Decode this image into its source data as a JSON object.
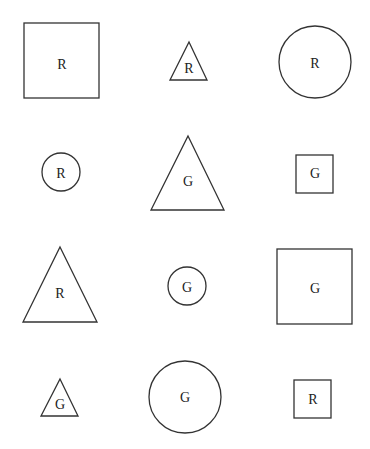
{
  "grid": {
    "rows": 4,
    "cols": 3,
    "shapes": [
      {
        "row": 1,
        "col": 1,
        "type": "square",
        "size": "large",
        "label": "R"
      },
      {
        "row": 1,
        "col": 2,
        "type": "triangle",
        "size": "small",
        "label": "R"
      },
      {
        "row": 1,
        "col": 3,
        "type": "circle",
        "size": "large",
        "label": "R"
      },
      {
        "row": 2,
        "col": 1,
        "type": "circle",
        "size": "small",
        "label": "R"
      },
      {
        "row": 2,
        "col": 2,
        "type": "triangle",
        "size": "large",
        "label": "G"
      },
      {
        "row": 2,
        "col": 3,
        "type": "square",
        "size": "small",
        "label": "G"
      },
      {
        "row": 3,
        "col": 1,
        "type": "triangle",
        "size": "large",
        "label": "R"
      },
      {
        "row": 3,
        "col": 2,
        "type": "circle",
        "size": "small",
        "label": "G"
      },
      {
        "row": 3,
        "col": 3,
        "type": "square",
        "size": "large",
        "label": "G"
      },
      {
        "row": 4,
        "col": 1,
        "type": "triangle",
        "size": "small",
        "label": "G"
      },
      {
        "row": 4,
        "col": 2,
        "type": "circle",
        "size": "large",
        "label": "G"
      },
      {
        "row": 4,
        "col": 3,
        "type": "square",
        "size": "small",
        "label": "R"
      }
    ]
  }
}
